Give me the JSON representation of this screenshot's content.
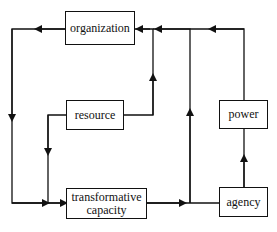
{
  "diagram": {
    "nodes": {
      "organization": {
        "label": "organization"
      },
      "resource": {
        "label": "resource"
      },
      "transformative_capacity": {
        "label": "transformative capacity"
      },
      "power": {
        "label": "power"
      },
      "agency": {
        "label": "agency"
      }
    },
    "edges": [
      {
        "from": "organization",
        "to": "transformative_capacity"
      },
      {
        "from": "resource",
        "to": "organization"
      },
      {
        "from": "resource",
        "to": "transformative_capacity"
      },
      {
        "from": "transformative_capacity",
        "to": "agency"
      },
      {
        "from": "transformative_capacity",
        "to": "organization"
      },
      {
        "from": "agency",
        "to": "power"
      },
      {
        "from": "power",
        "to": "organization"
      }
    ],
    "colors": {
      "line": "#111111",
      "background": "#ffffff"
    }
  }
}
